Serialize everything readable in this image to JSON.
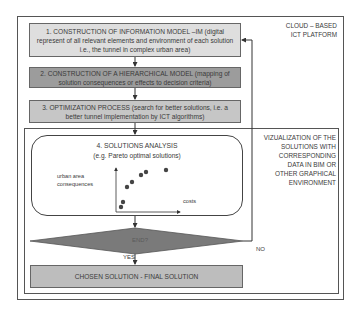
{
  "platform_label": {
    "line1": "CLOUD – BASED",
    "line2": "ICT PLATFORM"
  },
  "steps": [
    {
      "id": 1,
      "text": "1. CONSTRUCTION OF INFORMATION MODEL –IM (digital represent of all relevant elements and environment of each solution i.e., the tunnel in complex urban area)",
      "fill": "#dedede"
    },
    {
      "id": 2,
      "text": "2. CONSTRUCTION OF A HIERARCHICAL MODEL (mapping of solution consequences or effects to decision criteria)",
      "fill": "#9c9c9c"
    },
    {
      "id": 3,
      "text": "3. OPTIMIZATION PROCESS (search for better solutions, i.e. a better tunnel implementation by ICT algorithms)",
      "fill": "#c6c6c6"
    }
  ],
  "analysis": {
    "title": "4. SOLUTIONS ANALYSIS",
    "subtitle": "(e.g. Pareto optimal solutions)",
    "y_axis_label_line1": "urban area",
    "y_axis_label_line2": "consequences",
    "x_axis_label": "costs",
    "points": [
      [
        121,
        207
      ],
      [
        123,
        202
      ],
      [
        127,
        187
      ],
      [
        132,
        182
      ],
      [
        141,
        175
      ],
      [
        146,
        172
      ],
      [
        166,
        170
      ]
    ]
  },
  "visualization_label": {
    "lines": [
      "VIZUALIZATION OF THE",
      "SOLUTIONS WITH",
      "CORRESPONDING",
      "DATA IN BIM OR",
      "OTHER GRAPHICAL",
      "ENVIRONMENT"
    ]
  },
  "decision": {
    "text": "END?",
    "fill": "#7a7a7a",
    "yes_label": "YES",
    "no_label": "NO"
  },
  "final": {
    "text": "CHOSEN SOLUTION - FINAL SOLUTION",
    "fill": "#bdbdbd"
  }
}
